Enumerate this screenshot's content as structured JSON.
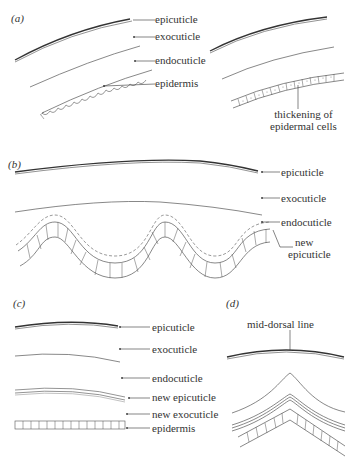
{
  "figure": {
    "panels": [
      {
        "id": "a",
        "tag": "(a)",
        "labels": [
          "epicuticle",
          "exocuticle",
          "endocuticle",
          "epidermis"
        ],
        "right_labels": [
          "thickening of",
          "epidermal cells"
        ]
      },
      {
        "id": "b",
        "tag": "(b)",
        "labels": [
          "epicuticle",
          "exocuticle",
          "endocuticle",
          "new",
          "epicuticle"
        ]
      },
      {
        "id": "c",
        "tag": "(c)",
        "labels": [
          "epicuticle",
          "exocuticle",
          "endocuticle",
          "new epicuticle",
          "new exocuticle",
          "epidermis"
        ]
      },
      {
        "id": "d",
        "tag": "(d)",
        "labels": [
          "mid-dorsal line"
        ]
      }
    ],
    "colors": {
      "line": "#333333",
      "text": "#333333",
      "background": "#ffffff"
    }
  }
}
